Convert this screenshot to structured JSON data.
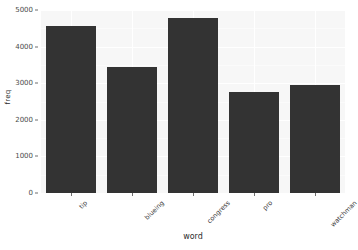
{
  "chart_data": {
    "type": "bar",
    "title": "",
    "xlabel": "word",
    "ylabel": "freq",
    "categories": [
      "tip",
      "blueing",
      "congress",
      "pro",
      "watchman"
    ],
    "values": [
      4570,
      3430,
      4790,
      2770,
      2960
    ],
    "ylim": [
      0,
      5000
    ],
    "yticks": [
      0,
      1000,
      2000,
      3000,
      4000,
      5000
    ],
    "ytick_labels": [
      "0",
      "1000",
      "2000",
      "3000",
      "4000",
      "5000"
    ],
    "grid": true,
    "legend": "none",
    "bar_color": "#333333",
    "panel_color": "#f7f7f7",
    "gridline_color": "#ffffff"
  }
}
